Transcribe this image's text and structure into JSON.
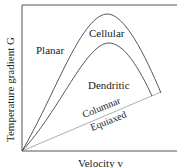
{
  "diagram": {
    "axes": {
      "x_label": "Velocity v",
      "y_label": "Temperature gradient G"
    },
    "regions": {
      "planar": "Planar",
      "cellular": "Cellular",
      "dendritic": "Dendritic",
      "columnar": "Columnar",
      "equiaxed": "Equiaxed"
    },
    "colors": {
      "frame": "#555555",
      "curve": "#444444",
      "line": "#999999",
      "text": "#222222"
    }
  }
}
